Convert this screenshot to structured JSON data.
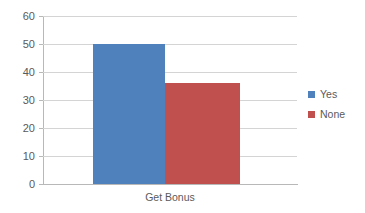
{
  "chart_data": {
    "type": "bar",
    "title": "",
    "subtitle": "",
    "xlabel": "",
    "ylabel": "",
    "categories": [
      "Get Bonus"
    ],
    "series": [
      {
        "name": "Yes",
        "values": [
          50
        ],
        "color": "#4f81bd"
      },
      {
        "name": "None",
        "values": [
          36
        ],
        "color": "#c0504d"
      }
    ],
    "ylim": [
      0,
      60
    ],
    "ytick_labels": [
      "60",
      "50",
      "40",
      "30",
      "20",
      "10",
      "0"
    ],
    "ytick_values": [
      60,
      50,
      40,
      30,
      20,
      10,
      0
    ],
    "ytick_step": 10,
    "grid": true,
    "grid_axis": "y",
    "legend_position": "right",
    "bar_layout": "adjacent",
    "background_color": "#ffffff",
    "gridline_color": "#d4d4d4",
    "axis_color": "#b8b8b8",
    "tick_text_color": "#5a5a5a"
  },
  "legend": {
    "entries": [
      {
        "label": "Yes",
        "swatch_color": "#4f81bd"
      },
      {
        "label": "None",
        "swatch_color": "#c0504d"
      }
    ]
  },
  "axis": {
    "category_label": "Get Bonus",
    "y_labels": {
      "t60": "60",
      "t50": "50",
      "t40": "40",
      "t30": "30",
      "t20": "20",
      "t10": "10",
      "t0": "0"
    }
  }
}
